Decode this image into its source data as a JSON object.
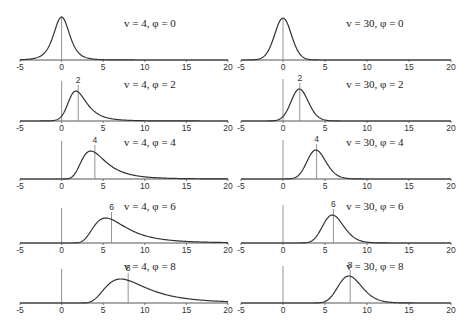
{
  "chart_data": {
    "type": "line",
    "title": "",
    "layout": {
      "rows": 5,
      "cols": 2,
      "grid": false,
      "legend": "none"
    },
    "xlim": [
      -5,
      20
    ],
    "xticks": [
      -5,
      0,
      5,
      10,
      15,
      20
    ],
    "xlabel": "",
    "ylabel": "",
    "panels": [
      {
        "row": 0,
        "col": 0,
        "label": "v = 4, φ = 0",
        "v": 4,
        "phi": 0,
        "peak_label": ""
      },
      {
        "row": 0,
        "col": 1,
        "label": "v = 30, φ = 0",
        "v": 30,
        "phi": 0,
        "peak_label": ""
      },
      {
        "row": 1,
        "col": 0,
        "label": "v = 4, φ = 2",
        "v": 4,
        "phi": 2,
        "peak_label": "2"
      },
      {
        "row": 1,
        "col": 1,
        "label": "v = 30, φ = 2",
        "v": 30,
        "phi": 2,
        "peak_label": "2"
      },
      {
        "row": 2,
        "col": 0,
        "label": "v = 4, φ = 4",
        "v": 4,
        "phi": 4,
        "peak_label": "4"
      },
      {
        "row": 2,
        "col": 1,
        "label": "v = 30, φ = 4",
        "v": 30,
        "phi": 4,
        "peak_label": "4"
      },
      {
        "row": 3,
        "col": 0,
        "label": "v = 4, φ = 6",
        "v": 4,
        "phi": 6,
        "peak_label": "6"
      },
      {
        "row": 3,
        "col": 1,
        "label": "v = 30, φ = 6",
        "v": 30,
        "phi": 6,
        "peak_label": "6"
      },
      {
        "row": 4,
        "col": 0,
        "label": "v = 4, φ = 8",
        "v": 4,
        "phi": 8,
        "peak_label": "8"
      },
      {
        "row": 4,
        "col": 1,
        "label": "v = 30, φ = 8",
        "v": 30,
        "phi": 8,
        "peak_label": "8"
      }
    ],
    "colors": {
      "curve": "#333333",
      "axis": "#555555",
      "marker_line": "#888888",
      "text": "#222222"
    }
  }
}
